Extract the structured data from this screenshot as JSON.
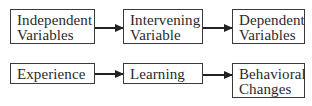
{
  "diagram": {
    "rows": [
      {
        "boxes": [
          {
            "lines": [
              "Independent",
              "Variables"
            ]
          },
          {
            "lines": [
              "Intervening",
              "Variable"
            ]
          },
          {
            "lines": [
              "Dependent",
              "Variables"
            ]
          }
        ]
      },
      {
        "boxes": [
          {
            "lines": [
              "Experience"
            ]
          },
          {
            "lines": [
              "Learning"
            ]
          },
          {
            "lines": [
              "Behavioral",
              "Changes"
            ]
          }
        ]
      }
    ],
    "colors": {
      "border": "#3a3a3a",
      "arrow": "#222222",
      "text": "#2a2a2a",
      "background": "#ffffff"
    }
  }
}
